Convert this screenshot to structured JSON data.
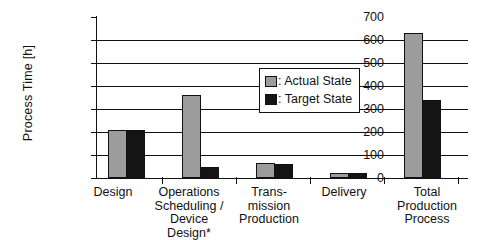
{
  "chart_data": {
    "type": "bar",
    "title": "",
    "xlabel": "",
    "ylabel": "Process Time [h]",
    "ylim": [
      0,
      700
    ],
    "ytick_step": 100,
    "yticks": [
      700,
      600,
      500,
      400,
      300,
      200,
      100,
      0
    ],
    "grid": true,
    "legend_position": "upper-center-right",
    "categories": [
      "Design",
      "Operations Scheduling / Device Design*",
      "Trans-mission Production",
      "Delivery",
      "Total Production Process"
    ],
    "category_lines": [
      [
        "Design"
      ],
      [
        "Operations",
        "Scheduling /",
        "Device",
        "Design*"
      ],
      [
        "Trans-",
        "mission",
        "Production"
      ],
      [
        "Delivery"
      ],
      [
        "Total",
        "Production",
        "Process"
      ]
    ],
    "series": [
      {
        "name": ": Actual State",
        "color": "#9c9c9c",
        "values": [
          210,
          360,
          65,
          20,
          630
        ]
      },
      {
        "name": ": Target State",
        "color": "#141414",
        "values": [
          210,
          50,
          60,
          20,
          340
        ]
      }
    ]
  },
  "legend": {
    "actual_label": ": Actual State",
    "target_label": ": Target State"
  },
  "axis": {
    "y_title": "Process Time [h]",
    "y_labels": [
      "700",
      "600",
      "500",
      "400",
      "300",
      "200",
      "100",
      "0"
    ]
  }
}
